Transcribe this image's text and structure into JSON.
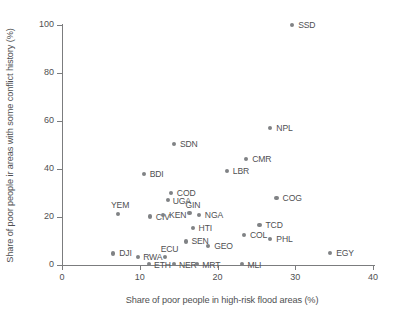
{
  "chart_data": {
    "type": "scatter",
    "title": "",
    "xlabel": "Share of poor people in high-risk flood areas (%)",
    "ylabel": "Share of poor people ir areas with some conflict history (%)",
    "xlim": [
      0,
      41
    ],
    "ylim": [
      0,
      105
    ],
    "xticks": [
      0,
      10,
      20,
      30,
      40
    ],
    "yticks": [
      0,
      20,
      40,
      60,
      80,
      100
    ],
    "xtick_labels": [
      "0",
      "10",
      "20",
      "30",
      "40"
    ],
    "ytick_labels": [
      "0",
      "20",
      "40",
      "60",
      "80",
      "100"
    ],
    "grid": false,
    "legend": "none",
    "marker_color": "#808285",
    "axis_color": "#7b7c7e",
    "points": [
      {
        "label": "SSD",
        "x": 29.6,
        "y": 100.0,
        "lx": 6,
        "ly": -4
      },
      {
        "label": "NPL",
        "x": 26.8,
        "y": 57.0,
        "lx": 6,
        "ly": -4
      },
      {
        "label": "SDN",
        "x": 14.4,
        "y": 50.5,
        "lx": 6,
        "ly": -4
      },
      {
        "label": "CMR",
        "x": 23.7,
        "y": 44.0,
        "lx": 6,
        "ly": -4
      },
      {
        "label": "LBR",
        "x": 21.2,
        "y": 39.0,
        "lx": 6,
        "ly": -4
      },
      {
        "label": "BDI",
        "x": 10.5,
        "y": 37.8,
        "lx": 6,
        "ly": -4
      },
      {
        "label": "COD",
        "x": 14.0,
        "y": 30.0,
        "lx": 6,
        "ly": -4
      },
      {
        "label": "UGA",
        "x": 13.6,
        "y": 27.0,
        "lx": 5,
        "ly": -3
      },
      {
        "label": "COG",
        "x": 27.6,
        "y": 28.0,
        "lx": 6,
        "ly": -4
      },
      {
        "label": "GIN",
        "x": 16.4,
        "y": 21.5,
        "lx": -4,
        "ly": -12
      },
      {
        "label": "NGA",
        "x": 17.6,
        "y": 21.0,
        "lx": 6,
        "ly": -4
      },
      {
        "label": "YEM",
        "x": 7.2,
        "y": 21.3,
        "lx": -7,
        "ly": -13
      },
      {
        "label": "CIV",
        "x": 11.3,
        "y": 20.2,
        "lx": 6,
        "ly": -4
      },
      {
        "label": "KEN",
        "x": 13.0,
        "y": 21.0,
        "lx": 6,
        "ly": -4
      },
      {
        "label": "TCD",
        "x": 25.4,
        "y": 16.8,
        "lx": 6,
        "ly": -4
      },
      {
        "label": "HTI",
        "x": 16.8,
        "y": 15.5,
        "lx": 6,
        "ly": -4
      },
      {
        "label": "COL",
        "x": 23.4,
        "y": 12.5,
        "lx": 6,
        "ly": -4
      },
      {
        "label": "PHL",
        "x": 26.8,
        "y": 11.0,
        "lx": 6,
        "ly": -4
      },
      {
        "label": "SEN",
        "x": 16.0,
        "y": 9.8,
        "lx": 5,
        "ly": -4
      },
      {
        "label": "GEO",
        "x": 18.8,
        "y": 8.0,
        "lx": 6,
        "ly": -4
      },
      {
        "label": "DJI",
        "x": 6.6,
        "y": 4.8,
        "lx": 6,
        "ly": -4
      },
      {
        "label": "EGY",
        "x": 34.5,
        "y": 5.0,
        "lx": 6,
        "ly": -4
      },
      {
        "label": "RWA",
        "x": 9.8,
        "y": 3.2,
        "lx": 5,
        "ly": -4
      },
      {
        "label": "ECU",
        "x": 13.2,
        "y": 3.2,
        "lx": -4,
        "ly": -12
      },
      {
        "label": "ETH",
        "x": 11.2,
        "y": 0.3,
        "lx": 5,
        "ly": -3
      },
      {
        "label": "NER",
        "x": 14.4,
        "y": 0.3,
        "lx": 5,
        "ly": -3
      },
      {
        "label": "MRT",
        "x": 17.4,
        "y": 0.3,
        "lx": 5,
        "ly": -3
      },
      {
        "label": "MLI",
        "x": 23.2,
        "y": 0.3,
        "lx": 5,
        "ly": -3
      }
    ]
  }
}
